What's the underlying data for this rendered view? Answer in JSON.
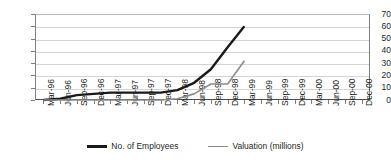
{
  "chart_data": {
    "type": "line",
    "title": "",
    "subtitle": "",
    "xlabel": "",
    "ylabel": "",
    "ylim": [
      0,
      70
    ],
    "ytick_step": 10,
    "yticks": [
      "70",
      "60",
      "50",
      "40",
      "30",
      "20",
      "10",
      "0"
    ],
    "grid": true,
    "legend_position": "bottom-center",
    "categories": [
      "Mar-96",
      "Jun-96",
      "Sep-96",
      "Dec-96",
      "Mar-97",
      "Jun-97",
      "Sep-97",
      "Dec-97",
      "Mar-98",
      "Jun-98",
      "Sep-98",
      "Dec-98",
      "Mar-99",
      "Jun-99",
      "Sep-99",
      "Dec-99",
      "Mar-00",
      "Jun-00",
      "Sep-00",
      "Dec-00"
    ],
    "series": [
      {
        "name": "No. of Employees",
        "color": "#1a1a1a",
        "width": 2.4,
        "values": [
          0,
          1,
          4,
          5,
          6,
          6,
          6,
          6,
          8,
          14,
          25,
          43,
          60,
          null,
          null,
          null,
          null,
          null,
          null,
          null
        ]
      },
      {
        "name": "Valuation (millions)",
        "color": "#8c8c8c",
        "width": 1.6,
        "values": [
          0,
          0,
          0,
          0,
          0,
          0,
          0,
          0,
          1,
          5,
          13,
          13,
          32,
          null,
          null,
          null,
          null,
          null,
          null,
          null
        ]
      }
    ]
  },
  "legend": {
    "entries": [
      {
        "label": "No. of Employees"
      },
      {
        "label": "Valuation (millions)"
      }
    ]
  }
}
